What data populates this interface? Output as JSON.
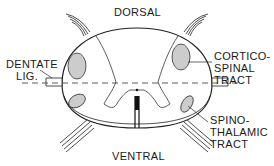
{
  "diagram": {
    "labels": {
      "dorsal": "DORSAL",
      "ventral": "VENTRAL",
      "dentate_line1": "DENTATE",
      "dentate_line2": "LIG.",
      "cortico_line1": "CORTICO-",
      "cortico_line2": "SPINAL",
      "cortico_line3": "TRACT",
      "spino_line1": "SPINO-",
      "spino_line2": "THALAMIC",
      "spino_line3": "TRACT"
    }
  }
}
